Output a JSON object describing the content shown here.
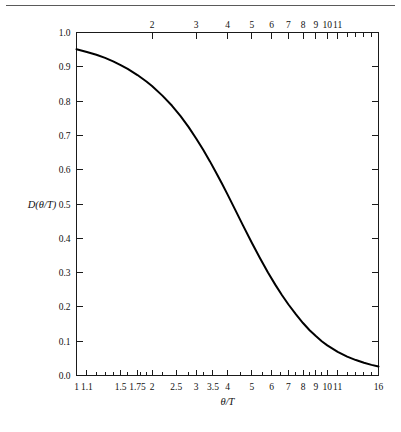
{
  "figure": {
    "has_top_rule": true,
    "background_color": "#ffffff",
    "curve_color": "#000000",
    "axis_color": "#1a1a1a"
  },
  "chart_data": {
    "type": "line",
    "title": "",
    "subtitle": "",
    "xlabel": "θ/T",
    "ylabel": "D(θ/T)",
    "xscale": "log",
    "yscale": "linear",
    "xlim": [
      1,
      16
    ],
    "ylim": [
      0.0,
      1.0
    ],
    "grid": false,
    "legend": null,
    "x_tick_labels_bottom": [
      "1",
      "1.1",
      "1.5",
      "1.75",
      "2",
      "2.5",
      "3",
      "3.5",
      "4",
      "5",
      "6",
      "7",
      "8",
      "9",
      "10",
      "11",
      "16"
    ],
    "x_tick_values_bottom": [
      1,
      1.1,
      1.5,
      1.75,
      2,
      2.5,
      3,
      3.5,
      4,
      5,
      6,
      7,
      8,
      9,
      10,
      11,
      16
    ],
    "x_minor_ticks_bottom": [
      1.2,
      1.3,
      1.4,
      1.6,
      1.8,
      1.9,
      2.2,
      2.8,
      3.2,
      4.5,
      5.5,
      6.5,
      7.5,
      8.5,
      9.5,
      12,
      13,
      14,
      15
    ],
    "x_tick_labels_top": [
      "2",
      "3",
      "4",
      "5",
      "6",
      "7",
      "8",
      "9",
      "10",
      "11"
    ],
    "x_tick_values_top": [
      2,
      3,
      4,
      5,
      6,
      7,
      8,
      9,
      10,
      11
    ],
    "x_minor_ticks_top": [
      12,
      13,
      14,
      15,
      16
    ],
    "y_tick_labels": [
      "0.0",
      "0.1",
      "0.2",
      "0.3",
      "0.4",
      "0.5",
      "0.6",
      "0.7",
      "0.8",
      "0.9",
      "1.0"
    ],
    "y_tick_values": [
      0.0,
      0.1,
      0.2,
      0.3,
      0.4,
      0.5,
      0.6,
      0.7,
      0.8,
      0.9,
      1.0
    ],
    "series": [
      {
        "name": "D(θ/T)",
        "x": [
          1.0,
          1.1,
          1.2,
          1.3,
          1.4,
          1.5,
          1.6,
          1.75,
          1.9,
          2.0,
          2.2,
          2.4,
          2.6,
          2.8,
          3.0,
          3.2,
          3.4,
          3.6,
          3.8,
          4.0,
          4.3,
          4.6,
          5.0,
          5.4,
          5.8,
          6.2,
          6.6,
          7.0,
          7.5,
          8.0,
          8.5,
          9.0,
          9.5,
          10.0,
          11.0,
          12.0,
          13.0,
          14.0,
          15.0,
          16.0
        ],
        "y": [
          0.951,
          0.943,
          0.935,
          0.926,
          0.916,
          0.905,
          0.894,
          0.876,
          0.857,
          0.844,
          0.816,
          0.787,
          0.756,
          0.724,
          0.691,
          0.658,
          0.625,
          0.592,
          0.56,
          0.528,
          0.482,
          0.439,
          0.387,
          0.341,
          0.3,
          0.265,
          0.234,
          0.207,
          0.178,
          0.153,
          0.132,
          0.115,
          0.1,
          0.088,
          0.069,
          0.055,
          0.045,
          0.037,
          0.031,
          0.026
        ]
      }
    ]
  }
}
